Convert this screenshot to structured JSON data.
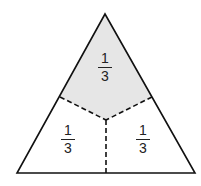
{
  "diagram": {
    "shape": "equilateral-triangle",
    "colors": {
      "stroke": "#111111",
      "shaded": "#e6e6e6",
      "background": "#ffffff"
    },
    "regions": [
      {
        "name": "top",
        "numerator": "1",
        "denominator": "3",
        "shaded": true
      },
      {
        "name": "bottom-left",
        "numerator": "1",
        "denominator": "3",
        "shaded": false
      },
      {
        "name": "bottom-right",
        "numerator": "1",
        "denominator": "3",
        "shaded": false
      }
    ]
  }
}
